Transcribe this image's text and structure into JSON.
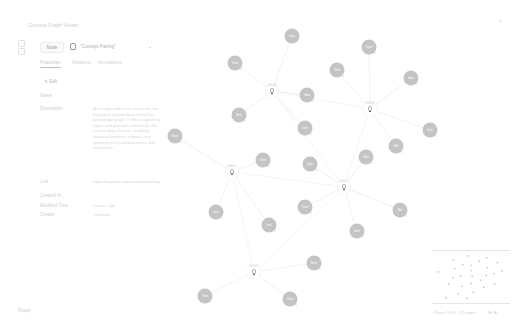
{
  "app": {
    "title": "Concept Graph Viewer",
    "close_label": "×",
    "footer": "Ready"
  },
  "toolbar": {
    "mode_label": "Node",
    "selector_value": "\"Concept Pairing\"",
    "chevron": "⌄"
  },
  "tabs": [
    {
      "label": "Properties",
      "active": true
    },
    {
      "label": "Relations",
      "active": false
    },
    {
      "label": "Annotations",
      "active": false
    }
  ],
  "panel": {
    "edit_label": "✎ Edit",
    "properties": [
      {
        "label": "Name",
        "value": "",
        "top": 93
      },
      {
        "label": "Description",
        "value": "A concept node that represents the pairing of related ideas within the knowledge graph. It links supporting topics and provides context for the surrounding clusters, enabling traversal between subjects and grouping of associated terms and references.",
        "top": 106
      },
      {
        "label": "Link",
        "value": "https://example.org/concepts/pairing",
        "top": 179
      },
      {
        "label": "Created At",
        "value": "",
        "top": 193
      },
      {
        "label": "Modified Time",
        "value": "2 hours ago",
        "top": 203
      },
      {
        "label": "Creator",
        "value": "Operator",
        "top": 212
      }
    ]
  },
  "graph": {
    "hubs": [
      {
        "id": "h1",
        "x": 272,
        "y": 91,
        "label": "Hub A"
      },
      {
        "id": "h2",
        "x": 370,
        "y": 109,
        "label": "Hub B"
      },
      {
        "id": "h3",
        "x": 232,
        "y": 172,
        "label": "Hub C"
      },
      {
        "id": "h4",
        "x": 344,
        "y": 187,
        "label": "Hub D"
      },
      {
        "id": "h5",
        "x": 254,
        "y": 272,
        "label": "Hub E"
      }
    ],
    "nodes": [
      {
        "x": 292,
        "y": 36,
        "label": "Topic",
        "hub": "h1"
      },
      {
        "x": 235,
        "y": 63,
        "label": "Term",
        "hub": "h1"
      },
      {
        "x": 307,
        "y": 95,
        "label": "Idea",
        "hub": "h1"
      },
      {
        "x": 239,
        "y": 115,
        "label": "Item",
        "hub": "h1"
      },
      {
        "x": 305,
        "y": 128,
        "label": "Link",
        "hub": "h1"
      },
      {
        "x": 369,
        "y": 47,
        "label": "Topic",
        "hub": "h2"
      },
      {
        "x": 337,
        "y": 70,
        "label": "Term",
        "hub": "h2"
      },
      {
        "x": 411,
        "y": 78,
        "label": "Idea",
        "hub": "h2"
      },
      {
        "x": 430,
        "y": 130,
        "label": "Item",
        "hub": "h2"
      },
      {
        "x": 396,
        "y": 146,
        "label": "Ref",
        "hub": "h2"
      },
      {
        "x": 175,
        "y": 136,
        "label": "Note",
        "hub": "h3"
      },
      {
        "x": 263,
        "y": 160,
        "label": "Term",
        "hub": "h3"
      },
      {
        "x": 216,
        "y": 212,
        "label": "Item",
        "hub": "h3"
      },
      {
        "x": 269,
        "y": 225,
        "label": "Link",
        "hub": "h3"
      },
      {
        "x": 310,
        "y": 164,
        "label": "Topic",
        "hub": "h4"
      },
      {
        "x": 366,
        "y": 157,
        "label": "Idea",
        "hub": "h4"
      },
      {
        "x": 305,
        "y": 207,
        "label": "Term",
        "hub": "h4"
      },
      {
        "x": 400,
        "y": 210,
        "label": "Ref",
        "hub": "h4"
      },
      {
        "x": 357,
        "y": 231,
        "label": "Item",
        "hub": "h4"
      },
      {
        "x": 314,
        "y": 263,
        "label": "Note",
        "hub": "h5"
      },
      {
        "x": 205,
        "y": 296,
        "label": "Item",
        "hub": "h5"
      },
      {
        "x": 290,
        "y": 299,
        "label": "Term",
        "hub": "h5"
      }
    ],
    "node_color": "#c4c4c4",
    "edge_color": "#eeeeee"
  },
  "minimap": {
    "footer_label": "Zoom 100%  ·  22 nodes",
    "zoom_icons": "⊖ ⊕"
  }
}
